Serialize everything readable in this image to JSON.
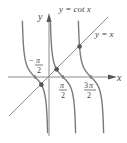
{
  "figure": {
    "curve_label": "y = cot x",
    "line_label": "y = x",
    "axes": {
      "x_label": "x",
      "y_label": "y"
    },
    "ticks": [
      {
        "num": "π",
        "den": "2",
        "sign": "−",
        "value": "-π/2"
      },
      {
        "num": "π",
        "den": "2",
        "sign": "",
        "value": "π/2"
      },
      {
        "num": "3π",
        "den": "2",
        "sign": "",
        "value": "3π/2"
      }
    ],
    "colors": {
      "curve": "#7a7a7a",
      "axis": "#8a8a8a",
      "point": "#555555",
      "text": "#444444"
    },
    "intersection_points": [
      {
        "x_approx": -0.86,
        "y_approx": -0.86
      },
      {
        "x_approx": 0.86,
        "y_approx": 0.86
      },
      {
        "x_approx": 3.43,
        "y_approx": 3.43
      }
    ]
  }
}
